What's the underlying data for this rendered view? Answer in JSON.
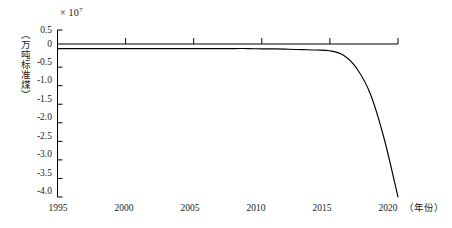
{
  "chart_data": {
    "type": "line",
    "title": "",
    "xlabel": "（年份）",
    "ylabel": "（万吨标准煤）",
    "y_multiplier": "× 10",
    "y_multiplier_exp": "7",
    "xlim": [
      1995,
      2020
    ],
    "ylim": [
      -4.0,
      0.5
    ],
    "grid": false,
    "legend": null,
    "xticks": [
      1995,
      2000,
      2005,
      2010,
      2015,
      2020
    ],
    "xtick_labels": [
      "1995",
      "2000",
      "2005",
      "2010",
      "2015",
      "2020"
    ],
    "yticks": [
      0.5,
      0.0,
      -0.5,
      -1.0,
      -1.5,
      -2.0,
      -2.5,
      -3.0,
      -3.5,
      -4.0
    ],
    "ytick_labels": [
      "0.5",
      "0",
      "-0.5",
      "-1.0",
      "-1.5",
      "-2.0",
      "-2.5",
      "-3.0",
      "-3.5",
      "-4.0"
    ],
    "series": [
      {
        "name": "累计节能量",
        "color": "#000000",
        "x": [
          1995,
          1996,
          1997,
          1998,
          1999,
          2000,
          2001,
          2002,
          2003,
          2004,
          2005,
          2006,
          2007,
          2008,
          2009,
          2010,
          2011,
          2012,
          2013,
          2014,
          2015,
          2016,
          2017,
          2018,
          2019,
          2020
        ],
        "y": [
          0.0,
          0.0,
          0.0,
          0.0,
          0.0,
          0.0,
          0.0,
          0.0,
          0.0,
          0.0,
          0.0,
          0.0,
          0.0,
          0.0,
          0.0,
          -0.01,
          -0.01,
          -0.02,
          -0.03,
          -0.04,
          -0.06,
          -0.18,
          -0.55,
          -1.25,
          -2.45,
          -4.0
        ]
      }
    ]
  }
}
